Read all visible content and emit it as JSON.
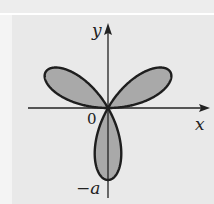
{
  "diagram": {
    "labels": {
      "x_axis": "x",
      "y_axis": "y",
      "origin": "0",
      "bottom_tick": "−a"
    },
    "curve": {
      "equation_form": "r = a sin 3θ",
      "petals": 3,
      "fill_color": "#a9a9a9",
      "stroke_color": "#1e1e1e"
    },
    "colors": {
      "background": "#e9e9e9",
      "axes": "#222222"
    }
  }
}
